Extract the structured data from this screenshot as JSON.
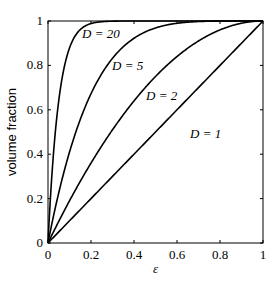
{
  "chart_data": {
    "type": "line",
    "title": "",
    "xlabel": "ε",
    "ylabel": "volume fraction",
    "xlim": [
      0,
      1
    ],
    "ylim": [
      0,
      1
    ],
    "grid": false,
    "x_ticks": [
      "0",
      "0.2",
      "0.4",
      "0.6",
      "0.8",
      "1"
    ],
    "y_ticks": [
      "0",
      "0.2",
      "0.4",
      "0.6",
      "0.8",
      "1"
    ],
    "formula": "1 - (1 - ε)^D",
    "series": [
      {
        "name": "D = 1",
        "D": 1,
        "x": [
          0,
          0.2,
          0.4,
          0.6,
          0.8,
          1
        ],
        "values": [
          0,
          0.2,
          0.4,
          0.6,
          0.8,
          1
        ]
      },
      {
        "name": "D = 2",
        "D": 2,
        "x": [
          0,
          0.2,
          0.4,
          0.6,
          0.8,
          1
        ],
        "values": [
          0,
          0.36,
          0.64,
          0.84,
          0.96,
          1
        ]
      },
      {
        "name": "D = 5",
        "D": 5,
        "x": [
          0,
          0.2,
          0.4,
          0.6,
          0.8,
          1
        ],
        "values": [
          0,
          0.672,
          0.922,
          0.99,
          1.0,
          1
        ]
      },
      {
        "name": "D = 20",
        "D": 20,
        "x": [
          0,
          0.2,
          0.4,
          0.6,
          0.8,
          1
        ],
        "values": [
          0,
          0.988,
          1.0,
          1.0,
          1.0,
          1
        ]
      }
    ],
    "annotations": [
      "D = 20",
      "D = 5",
      "D = 2",
      "D = 1"
    ]
  }
}
